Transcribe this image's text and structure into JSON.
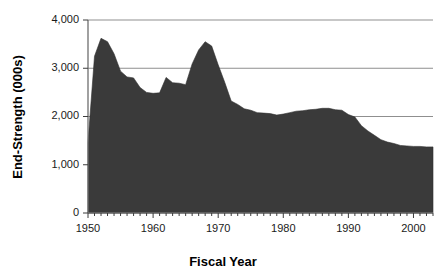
{
  "chart_data": {
    "type": "area",
    "title": "",
    "xlabel": "Fiscal Year",
    "ylabel": "End-Strength (000s)",
    "xlim": [
      1950,
      2003
    ],
    "ylim": [
      0,
      4000
    ],
    "grid": true,
    "legend": null,
    "series_name": "End-Strength",
    "fill_color": "#3a3a3a",
    "x": [
      1950,
      1951,
      1952,
      1953,
      1954,
      1955,
      1956,
      1957,
      1958,
      1959,
      1960,
      1961,
      1962,
      1963,
      1964,
      1965,
      1966,
      1967,
      1968,
      1969,
      1970,
      1971,
      1972,
      1973,
      1974,
      1975,
      1976,
      1977,
      1978,
      1979,
      1980,
      1981,
      1982,
      1983,
      1984,
      1985,
      1986,
      1987,
      1988,
      1989,
      1990,
      1991,
      1992,
      1993,
      1994,
      1995,
      1996,
      1997,
      1998,
      1999,
      2000,
      2001,
      2002,
      2003
    ],
    "values": [
      1460,
      3250,
      3620,
      3550,
      3300,
      2940,
      2820,
      2800,
      2600,
      2500,
      2480,
      2490,
      2810,
      2700,
      2690,
      2660,
      3090,
      3380,
      3550,
      3460,
      3070,
      2710,
      2320,
      2250,
      2160,
      2130,
      2080,
      2070,
      2060,
      2030,
      2050,
      2080,
      2110,
      2120,
      2140,
      2150,
      2170,
      2170,
      2140,
      2130,
      2040,
      1990,
      1810,
      1700,
      1610,
      1520,
      1470,
      1440,
      1400,
      1390,
      1380,
      1380,
      1370,
      1370
    ]
  },
  "axes": {
    "y_ticks": [
      "0",
      "1,000",
      "2,000",
      "3,000",
      "4,000"
    ],
    "y_tick_values": [
      0,
      1000,
      2000,
      3000,
      4000
    ],
    "x_ticks": [
      "1950",
      "1960",
      "1970",
      "1980",
      "1990",
      "2000"
    ],
    "x_tick_values": [
      1950,
      1960,
      1970,
      1980,
      1990,
      2000
    ],
    "x_title": "Fiscal Year",
    "y_title": "End-Strength (000s)"
  }
}
